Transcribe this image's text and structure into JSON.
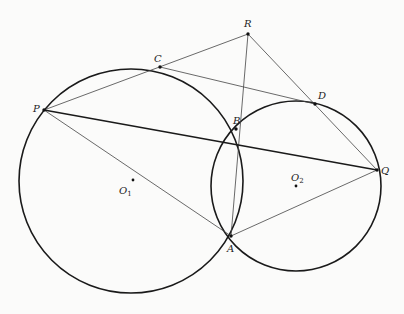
{
  "diagram": {
    "title": "",
    "circles": [
      {
        "name": "O1",
        "center": [
          131,
          181
        ],
        "r": 112,
        "stroke": "#1a1a1a"
      },
      {
        "name": "O2",
        "center": [
          296,
          186
        ],
        "r": 85,
        "stroke": "#1a1a1a"
      }
    ],
    "points": {
      "R": {
        "x": 248,
        "y": 34,
        "label": "R",
        "lx": 244,
        "ly": 27
      },
      "C": {
        "x": 160,
        "y": 67,
        "label": "C",
        "lx": 154,
        "ly": 62
      },
      "D": {
        "x": 315,
        "y": 104,
        "label": "D",
        "lx": 318,
        "ly": 99
      },
      "P": {
        "x": 44,
        "y": 110,
        "label": "P",
        "lx": 33,
        "ly": 112
      },
      "B": {
        "x": 236,
        "y": 129,
        "label": "B",
        "lx": 233,
        "ly": 124
      },
      "Q": {
        "x": 377,
        "y": 170,
        "label": "Q",
        "lx": 381,
        "ly": 174
      },
      "A": {
        "x": 231,
        "y": 236,
        "label": "A",
        "lx": 227,
        "ly": 252
      },
      "O1": {
        "x": 133,
        "y": 180,
        "label": "O",
        "sub": "1",
        "lx": 119,
        "ly": 194
      },
      "O2": {
        "x": 296,
        "y": 186,
        "label": "O",
        "sub": "2",
        "lx": 291,
        "ly": 181
      }
    },
    "thin_segments": [
      [
        "P",
        "R"
      ],
      [
        "R",
        "Q"
      ],
      [
        "R",
        "A"
      ],
      [
        "C",
        "D"
      ],
      [
        "P",
        "A"
      ],
      [
        "A",
        "Q"
      ]
    ],
    "thick_segments": [
      [
        "P",
        "Q"
      ]
    ]
  }
}
